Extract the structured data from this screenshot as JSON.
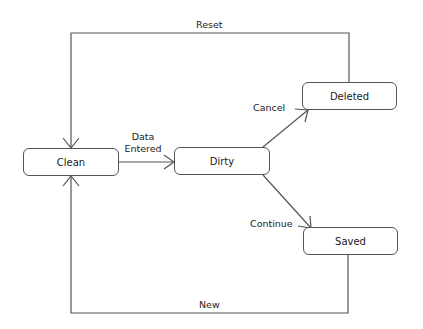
{
  "diagram": {
    "type": "state-machine",
    "states": [
      {
        "id": "clean",
        "label": "Clean"
      },
      {
        "id": "dirty",
        "label": "Dirty"
      },
      {
        "id": "deleted",
        "label": "Deleted"
      },
      {
        "id": "saved",
        "label": "Saved"
      }
    ],
    "transitions": [
      {
        "from": "clean",
        "to": "dirty",
        "label_line1": "Data",
        "label_line2": "Entered"
      },
      {
        "from": "dirty",
        "to": "deleted",
        "label": "Cancel"
      },
      {
        "from": "dirty",
        "to": "saved",
        "label": "Continue"
      },
      {
        "from": "deleted",
        "to": "clean",
        "label": "Reset"
      },
      {
        "from": "saved",
        "to": "clean",
        "label": "New"
      }
    ],
    "colors": {
      "line": "#555555",
      "text": "#222222",
      "background": "#ffffff"
    }
  }
}
